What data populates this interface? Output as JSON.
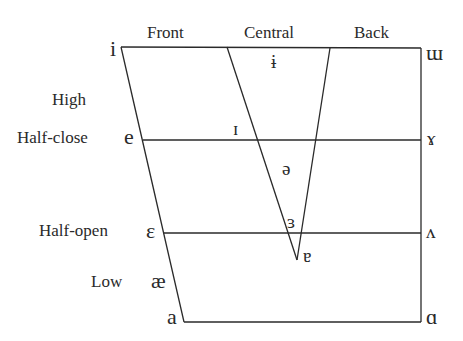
{
  "diagram": {
    "type": "vowel-quadrilateral",
    "column_labels": {
      "front": "Front",
      "central": "Central",
      "back": "Back"
    },
    "row_labels": {
      "high": "High",
      "half_close": "Half-close",
      "half_open": "Half-open",
      "low": "Low"
    },
    "vowels": {
      "close_front": "i",
      "close_central": "ɨ",
      "close_back": "ɯ",
      "near_close_front": "ɪ",
      "close_mid_front": "e",
      "close_mid_back": "ɤ",
      "mid_central": "ə",
      "open_mid_central": "ɜ",
      "open_mid_front": "ɛ",
      "open_mid_back": "ʌ",
      "near_open_central": "ɐ",
      "near_open_front": "æ",
      "open_front": "a",
      "open_back": "ɑ"
    },
    "line_color": "#2a2a2a"
  }
}
